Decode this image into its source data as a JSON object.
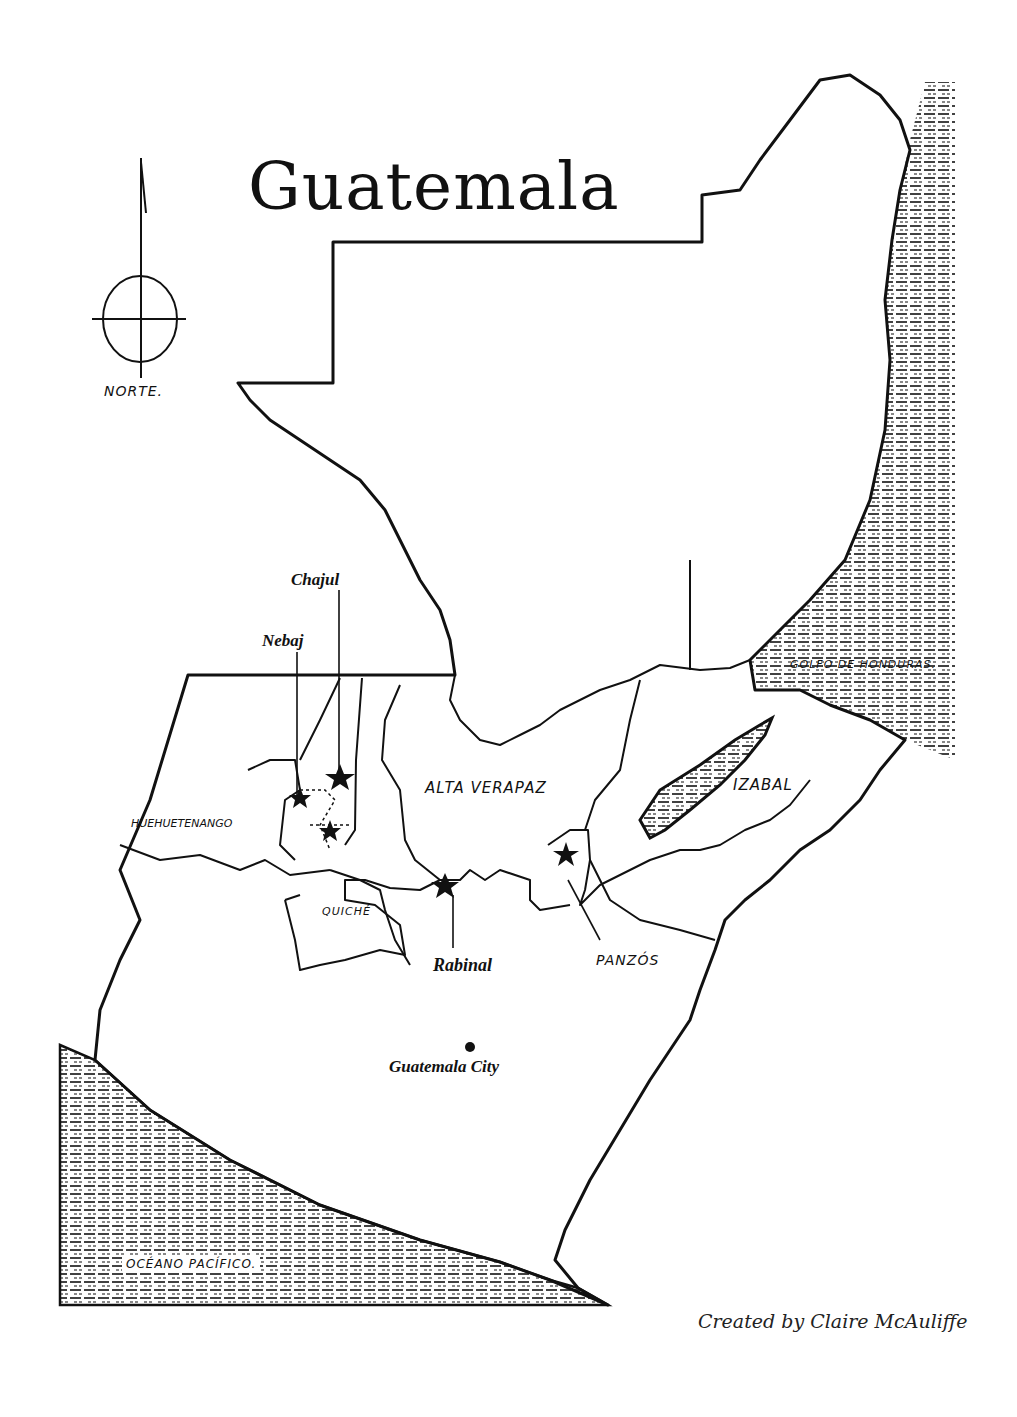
{
  "map": {
    "title": "Guatemala",
    "compass": {
      "label": "NORTE.",
      "icon": "north-arrow-compass"
    },
    "regions": [
      {
        "name": "HUEHUETENANGO"
      },
      {
        "name": "QUICHÉ"
      },
      {
        "name": "ALTA VERAPAZ"
      },
      {
        "name": "IZABAL"
      }
    ],
    "water_bodies": [
      {
        "name": "GOLFO DE HONDURAS."
      },
      {
        "name": "OCÉANO PACÍFICO."
      }
    ],
    "sites": [
      {
        "name": "Chajul",
        "marker": "star"
      },
      {
        "name": "Nebaj",
        "marker": "star"
      },
      {
        "name": "Rabinal",
        "marker": "star"
      },
      {
        "name": "PANZÓS",
        "marker": "star"
      }
    ],
    "capital": {
      "name": "Guatemala City",
      "marker": "dot"
    },
    "credit": "Created by Claire McAuliffe"
  }
}
